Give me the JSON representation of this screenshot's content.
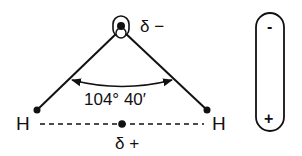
{
  "diagram": {
    "title": "",
    "molecule": "water",
    "atoms": {
      "oxygen": {
        "label": "",
        "partial_charge": "δ −"
      },
      "hydrogen_left": {
        "label": "H"
      },
      "hydrogen_right": {
        "label": "H"
      }
    },
    "bond_angle": "104° 40′",
    "hydrogen_midpoint_charge": "δ +",
    "dipole": {
      "negative_end": "-",
      "positive_end": "+"
    },
    "colors": {
      "stroke": "#111111",
      "background": "#ffffff"
    }
  }
}
